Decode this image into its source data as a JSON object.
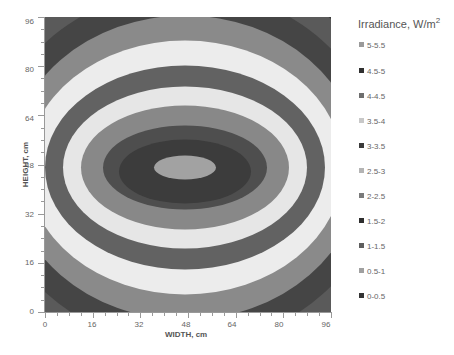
{
  "chart_data": {
    "type": "heatmap",
    "subtype": "contour",
    "title": "",
    "xlabel": "WIDTH, cm",
    "ylabel": "HEIGHT, cm",
    "xlim": [
      0,
      96
    ],
    "ylim": [
      0,
      96
    ],
    "x_ticks": [
      "0",
      "16",
      "32",
      "48",
      "64",
      "80",
      "96"
    ],
    "y_ticks": [
      "96",
      "80",
      "64",
      "48",
      "32",
      "16",
      "0"
    ],
    "grid": false,
    "legend": {
      "title": "Irradiance, W/m",
      "title_superscript": "2",
      "position": "right",
      "entries": [
        {
          "label": "5-5.5",
          "color": "#9a9a9a"
        },
        {
          "label": "4.5-5",
          "color": "#303030"
        },
        {
          "label": "4-4.5",
          "color": "#6e6e6e"
        },
        {
          "label": "3.5-4",
          "color": "#c8c8c8"
        },
        {
          "label": "3-3.5",
          "color": "#3a3a3a"
        },
        {
          "label": "2.5-3",
          "color": "#b4b4b4"
        },
        {
          "label": "2-2.5",
          "color": "#7a7a7a"
        },
        {
          "label": "1.5-2",
          "color": "#2e2e2e"
        },
        {
          "label": "1-1.5",
          "color": "#5e5e5e"
        },
        {
          "label": "0.5-1",
          "color": "#a0a0a0"
        },
        {
          "label": "0-0.5",
          "color": "#333333"
        }
      ]
    },
    "center": {
      "width_cm": 48,
      "height_cm": 48
    },
    "bands_outer_to_inner": [
      {
        "range": "0-0.5",
        "color": "#3a3a3a",
        "rx": 250,
        "ry": 230,
        "cy_offset": 0
      },
      {
        "range": "0.5-1",
        "color": "#5a5a5a",
        "rx": 218,
        "ry": 200,
        "cy_offset": 0
      },
      {
        "range": "1-1.5",
        "color": "#454545",
        "rx": 196,
        "ry": 178,
        "cy_offset": 0
      },
      {
        "range": "1.5-2",
        "color": "#8a8a8a",
        "rx": 176,
        "ry": 152,
        "cy_offset": 0
      },
      {
        "range": "2-2.5",
        "color": "#ececec",
        "rx": 158,
        "ry": 127,
        "cy_offset": 0
      },
      {
        "range": "2.5-3",
        "color": "#626262",
        "rx": 140,
        "ry": 102,
        "cy_offset": 0
      },
      {
        "range": "3-3.5",
        "color": "#e6e6e6",
        "rx": 122,
        "ry": 81,
        "cy_offset": 0
      },
      {
        "range": "3.5-4",
        "color": "#888888",
        "rx": 104,
        "ry": 62,
        "cy_offset": 0
      },
      {
        "range": "4-4.5",
        "color": "#4e4e4e",
        "rx": 82,
        "ry": 42,
        "cy_offset": 0
      },
      {
        "range": "4.5-5",
        "color": "#3c3c3c",
        "rx": 66,
        "ry": 32,
        "cy_offset": 4
      },
      {
        "range": "5-5.5",
        "color": "#a2a2a2",
        "rx": 31,
        "ry": 12,
        "cy_offset": 0
      }
    ]
  }
}
